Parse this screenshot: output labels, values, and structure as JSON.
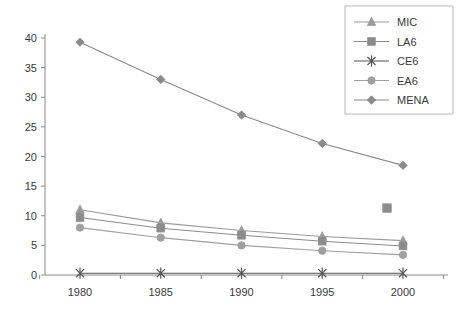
{
  "chart_data": {
    "type": "line",
    "title": "",
    "xlabel": "",
    "ylabel": "",
    "x": [
      1980,
      1985,
      1990,
      1995,
      2000
    ],
    "categories": [
      "1980",
      "1985",
      "1990",
      "1995",
      "2000"
    ],
    "xtick_labels": [
      "1980",
      "1985",
      "1990",
      "1995",
      "2000"
    ],
    "ytick_labels": [
      "0",
      "5",
      "10",
      "15",
      "20",
      "25",
      "30",
      "35",
      "40"
    ],
    "ytick_values": [
      0,
      5,
      10,
      15,
      20,
      25,
      30,
      35,
      40
    ],
    "ylim": [
      0,
      40
    ],
    "xlim": [
      1977.5,
      2002.5
    ],
    "grid": false,
    "legend_position": "top-right",
    "series": [
      {
        "name": "MIC",
        "marker": "triangle",
        "color": "#9a9a9a",
        "values": [
          11.0,
          8.8,
          7.5,
          6.5,
          5.8
        ]
      },
      {
        "name": "LA6",
        "marker": "square",
        "color": "#8c8c8c",
        "values": [
          9.7,
          7.9,
          6.7,
          5.7,
          4.9
        ]
      },
      {
        "name": "CE6",
        "marker": "asterisk",
        "color": "#555555",
        "values": [
          0.3,
          0.3,
          0.3,
          0.3,
          0.3
        ]
      },
      {
        "name": "EA6",
        "marker": "circle",
        "color": "#a0a0a0",
        "values": [
          8.0,
          6.3,
          5.0,
          4.1,
          3.4
        ]
      },
      {
        "name": "MENA",
        "marker": "diamond",
        "color": "#8a8a8a",
        "values": [
          39.3,
          33.0,
          27.0,
          22.2,
          18.5
        ]
      }
    ],
    "stray_markers": [
      {
        "name": "LA6-outlier-2000",
        "series": "LA6",
        "marker": "square",
        "color": "#8c8c8c",
        "x_px": 387,
        "value": 11.3
      }
    ]
  },
  "legend": {
    "entries": [
      "MIC",
      "LA6",
      "CE6",
      "EA6",
      "MENA"
    ]
  }
}
